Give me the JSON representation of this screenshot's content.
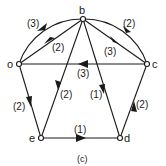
{
  "diagram": {
    "type": "directed-weighted-graph",
    "caption": "(c)",
    "nodes": [
      {
        "id": "b",
        "label": "b"
      },
      {
        "id": "o",
        "label": "o"
      },
      {
        "id": "c",
        "label": "c"
      },
      {
        "id": "e",
        "label": "e"
      },
      {
        "id": "d",
        "label": "d"
      }
    ],
    "edges": [
      {
        "from": "b",
        "to": "o",
        "weight": "(3)",
        "shape": "arc"
      },
      {
        "from": "o",
        "to": "b",
        "weight": "(2)",
        "shape": "line"
      },
      {
        "from": "c",
        "to": "b",
        "weight": "(2)",
        "shape": "arc"
      },
      {
        "from": "b",
        "to": "c",
        "weight": "(3)",
        "shape": "line"
      },
      {
        "from": "c",
        "to": "o",
        "weight": "(3)",
        "shape": "line"
      },
      {
        "from": "b",
        "to": "e",
        "weight": "(2)",
        "shape": "line"
      },
      {
        "from": "b",
        "to": "d",
        "weight": "(1)",
        "shape": "line"
      },
      {
        "from": "o",
        "to": "e",
        "weight": "(2)",
        "shape": "line"
      },
      {
        "from": "e",
        "to": "d",
        "weight": "(1)",
        "shape": "line"
      },
      {
        "from": "d",
        "to": "c",
        "weight": "(2)",
        "shape": "line"
      }
    ]
  }
}
